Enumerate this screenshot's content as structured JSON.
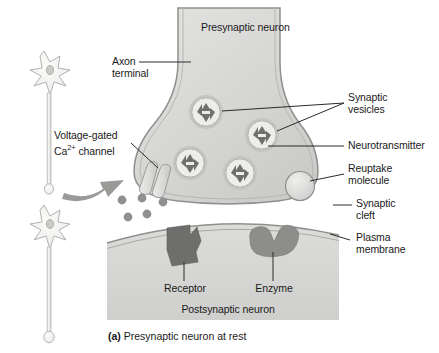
{
  "figure": {
    "caption_prefix": "(a)",
    "caption_text": "Presynaptic neuron at rest",
    "width": 439,
    "height": 353
  },
  "labels": {
    "presynaptic_neuron": "Presynaptic neuron",
    "axon_terminal": "Axon\nterminal",
    "voltage_gated_channel_line1": "Voltage-gated",
    "voltage_gated_channel_line2_pre": "Ca",
    "voltage_gated_channel_sup": "2+",
    "voltage_gated_channel_line2_post": " channel",
    "synaptic_vesicles": "Synaptic\nvesicles",
    "neurotransmitter": "Neurotransmitter",
    "reuptake_molecule": "Reuptake\nmolecule",
    "synaptic_cleft": "Synaptic\ncleft",
    "plasma_membrane": "Plasma\nmembrane",
    "receptor": "Receptor",
    "enzyme": "Enzyme",
    "postsynaptic_neuron": "Postsynaptic neuron"
  },
  "colors": {
    "presynaptic_fill": "#d8d8d6",
    "postsynaptic_fill": "#d6d6d4",
    "membrane_stroke": "#8f8f8d",
    "vesicle_fill": "#ececeb",
    "vesicle_ring": "#b4b4b2",
    "neurotransmitter_fill": "#6f6f6d",
    "receptor_fill": "#6e6e6c",
    "enzyme_fill": "#8d8d8b",
    "reuptake_fill": "#dcdcda",
    "channel_fill": "#dcdcda",
    "arrow_fill": "#9a9a98",
    "neuron_fill": "#eeeeec",
    "leader_stroke": "#2a2a2a",
    "dot_fill": "#909090",
    "background": "#ffffff"
  },
  "structures": {
    "vesicle_count": 4,
    "neurotransmitter_per_vesicle": 4,
    "cleft_dot_count": 5,
    "neuron_count": 2
  }
}
